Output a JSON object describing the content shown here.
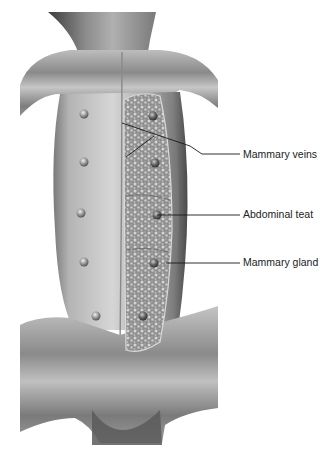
{
  "figure": {
    "colors": {
      "background": "#ffffff",
      "skin_light": "#d8d8d8",
      "skin_mid": "#a8a8a8",
      "skin_dark": "#6e6e6e",
      "gland": "#9a9a9a",
      "leader_line": "#1a1a1a",
      "label_text": "#222222"
    }
  },
  "labels": [
    {
      "id": "mammary-veins",
      "text": "Mammary veins",
      "x": 243,
      "y": 150
    },
    {
      "id": "abdominal-teat",
      "text": "Abdominal teat",
      "x": 243,
      "y": 209
    },
    {
      "id": "mammary-gland",
      "text": "Mammary gland",
      "x": 243,
      "y": 258
    }
  ],
  "teats_left": [
    {
      "cx": 84,
      "cy": 114
    },
    {
      "cx": 84,
      "cy": 162
    },
    {
      "cx": 81,
      "cy": 213
    },
    {
      "cx": 84,
      "cy": 262
    },
    {
      "cx": 96,
      "cy": 316
    }
  ],
  "teats_right": [
    {
      "cx": 153,
      "cy": 116
    },
    {
      "cx": 155,
      "cy": 163
    },
    {
      "cx": 157,
      "cy": 215
    },
    {
      "cx": 154,
      "cy": 263
    },
    {
      "cx": 143,
      "cy": 316
    }
  ]
}
